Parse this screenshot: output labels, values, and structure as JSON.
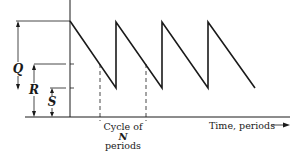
{
  "diagram": {
    "title": "",
    "type": "inventory-sawtooth",
    "labels": {
      "q": "Q",
      "r": "R",
      "s": "S",
      "cycle_line1": "Cycle of",
      "cycle_line2": "N",
      "cycle_line3": "periods",
      "x_axis": "Time, periods"
    },
    "levels": {
      "peak_label": "Q + S",
      "reorder_label": "R",
      "safety_label": "S"
    },
    "colors": {
      "line": "#1a1a1a",
      "background": "#ffffff"
    }
  }
}
